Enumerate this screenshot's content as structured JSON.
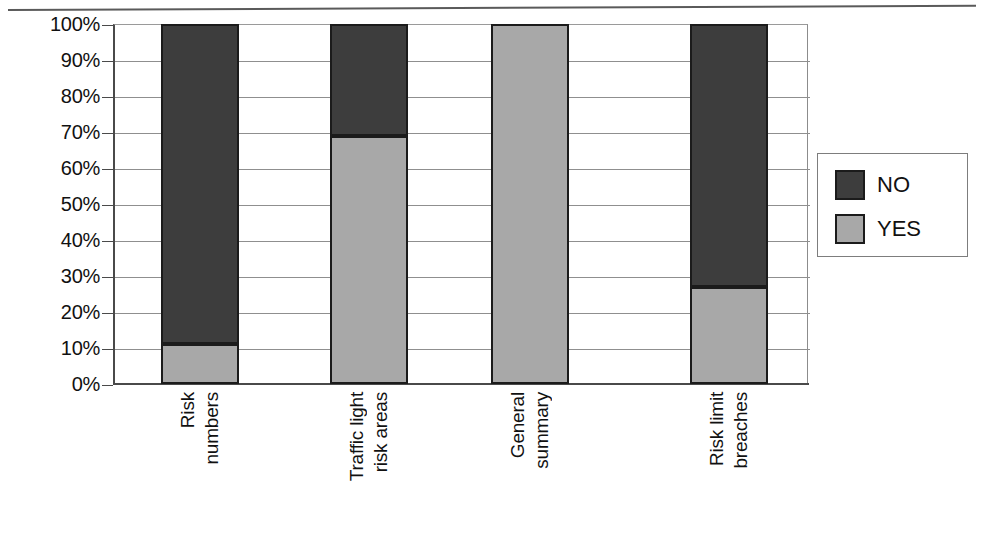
{
  "chart_data": {
    "type": "bar",
    "subtype": "stacked-100-percent",
    "title": "",
    "xlabel": "",
    "ylabel": "",
    "ylim": [
      0,
      100
    ],
    "grid": true,
    "legend_position": "right",
    "categories": [
      "Risk numbers",
      "Traffic light risk areas",
      "General summary",
      "Risk limit breaches"
    ],
    "category_lines": [
      [
        "Risk",
        "numbers"
      ],
      [
        "Traffic light",
        "risk areas"
      ],
      [
        "General",
        "summary"
      ],
      [
        "Risk limit",
        "breaches"
      ]
    ],
    "series": [
      {
        "name": "NO",
        "color": "#3d3d3d",
        "values": [
          89,
          31,
          0,
          73
        ]
      },
      {
        "name": "YES",
        "color": "#a8a8a8",
        "values": [
          11,
          69,
          100,
          27
        ]
      }
    ],
    "ytick_labels": [
      "100%",
      "90%",
      "80%",
      "70%",
      "60%",
      "50%",
      "40%",
      "30%",
      "20%",
      "10%",
      "0%"
    ],
    "ytick_values": [
      100,
      90,
      80,
      70,
      60,
      50,
      40,
      30,
      20,
      10,
      0
    ]
  },
  "legend": {
    "entries": [
      {
        "label": "NO",
        "swatch": "no-swatch"
      },
      {
        "label": "YES",
        "swatch": "yes-swatch"
      }
    ]
  },
  "artifact": {
    "ghost_text": ""
  }
}
